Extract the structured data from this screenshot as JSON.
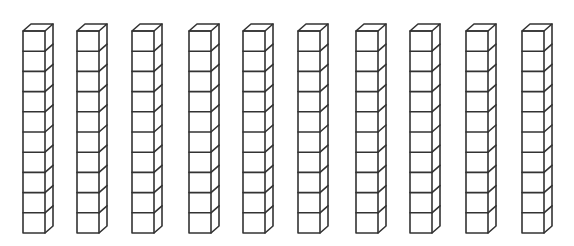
{
  "diagram": {
    "title": "",
    "rod_count": 10,
    "cubes_per_rod": 10,
    "total_units": 100,
    "stroke_color": "#333333",
    "background_color": "#ffffff",
    "rod_x_positions": [
      23,
      77,
      132,
      189,
      243,
      298,
      356,
      410,
      466,
      522
    ],
    "geometry": {
      "top_y": 31,
      "cube_width": 22,
      "cube_height": 20.2,
      "depth_dx": 8,
      "depth_dy": -7
    }
  }
}
